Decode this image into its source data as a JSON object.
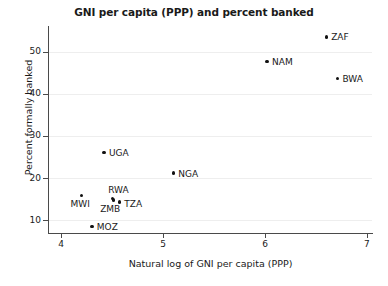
{
  "chart_data": {
    "type": "scatter",
    "title": "GNI per capita (PPP) and percent banked",
    "xlabel": "Natural log of GNI per capita (PPP)",
    "ylabel": "Percent formally banked",
    "xlim": [
      3.87,
      7.05
    ],
    "ylim": [
      7.2,
      55.6
    ],
    "xticks": [
      4,
      5,
      6,
      7
    ],
    "xtick_labels": [
      "4",
      "5",
      "6",
      "7"
    ],
    "yticks": [
      10,
      20,
      30,
      40,
      50
    ],
    "ytick_labels": [
      "10",
      "20",
      "30",
      "40",
      "50"
    ],
    "grid": "horizontal",
    "legend": "none",
    "marker_color": "#111111",
    "grid_color": "#eeeeee",
    "axis_color": "#4a4a4a",
    "points": [
      {
        "label": "ZAF",
        "x": 6.6,
        "y": 53.5,
        "label_dx": 5,
        "label_dy": -3.5
      },
      {
        "label": "NAM",
        "x": 6.02,
        "y": 47.7,
        "label_dx": 5,
        "label_dy": -3.5
      },
      {
        "label": "BWA",
        "x": 6.71,
        "y": 43.6,
        "label_dx": 5,
        "label_dy": -3.5
      },
      {
        "label": "UGA",
        "x": 4.42,
        "y": 26.1,
        "label_dx": 5,
        "label_dy": -3.5
      },
      {
        "label": "NGA",
        "x": 5.1,
        "y": 21.2,
        "label_dx": 5,
        "label_dy": -3.5
      },
      {
        "label": "MWI",
        "x": 4.2,
        "y": 15.9,
        "label_dx": -11,
        "label_dy": 5
      },
      {
        "label": "RWA",
        "x": 4.5,
        "y": 15.2,
        "label_dx": -4,
        "label_dy": -12
      },
      {
        "label": "ZMB",
        "x": 4.51,
        "y": 14.8,
        "label_dx": -13,
        "label_dy": 5
      },
      {
        "label": "TZA",
        "x": 4.57,
        "y": 14.3,
        "label_dx": 5,
        "label_dy": -2.5
      },
      {
        "label": "MOZ",
        "x": 4.3,
        "y": 8.5,
        "label_dx": 5,
        "label_dy": -3.5
      }
    ]
  }
}
